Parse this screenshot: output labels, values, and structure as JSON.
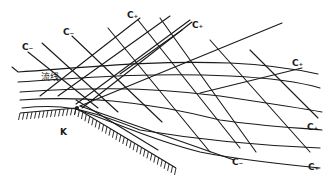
{
  "diagram": {
    "title": "",
    "labels": {
      "c_minus_1": "C₋",
      "c_minus_2": "C₋",
      "c_plus_top_1": "C₊",
      "c_plus_top_2": "C₊",
      "c_plus_right_1": "C₊",
      "c_plus_right_2": "C₊",
      "c_plus_right_3": "C₊",
      "c_minus_bottom": "C₋",
      "streamline": "流线",
      "corner": "K"
    },
    "colors": {
      "ink": "#1a1a1a",
      "background": "#ffffff"
    }
  }
}
